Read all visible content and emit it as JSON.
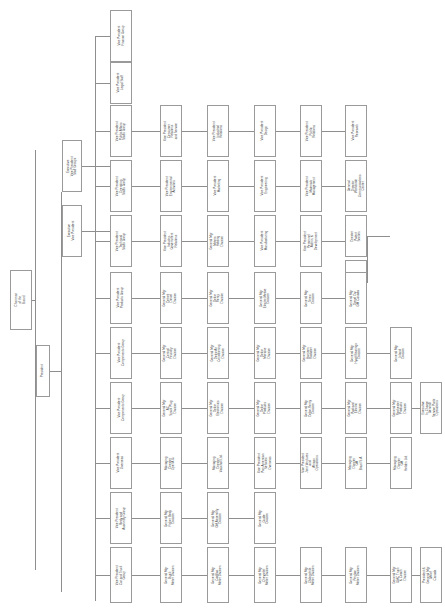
{
  "chart": {
    "orientation": "rotated-90",
    "box_fill": "#ffffff",
    "box_border": "#9a9a9a",
    "line_color": "#8e8e8e",
    "nodes": [
      {
        "id": "chairman",
        "label": "Chairman\nof the\nBoard"
      },
      {
        "id": "president",
        "label": "President"
      },
      {
        "id": "evp_staff",
        "label": "Executive\nVice President\nStaff Groups"
      },
      {
        "id": "vp_finance",
        "label": "Vice President\nFinance Group"
      },
      {
        "id": "vp_legal",
        "label": "Vice President\nLegal Staff"
      },
      {
        "id": "vp_pubaffairs",
        "label": "Vice President\nPublic Affairs\nStaffs Group"
      },
      {
        "id": "vp_operating",
        "label": "Vice President\nOperating\nStaffs Group"
      },
      {
        "id": "vp_technical",
        "label": "Vice President\nTechnical\nStaffs Group"
      },
      {
        "id": "vp_consumer",
        "label": "Vice President\nConsumer\nRelations\nand Service"
      },
      {
        "id": "vp_environ",
        "label": "Vice President\nEnvironmental\nActivities"
      },
      {
        "id": "vp_indgov",
        "label": "Vice President\nIndustry-\nGovernment\nRelations"
      },
      {
        "id": "vp_public",
        "label": "Vice President\nPublic\nRelations"
      },
      {
        "id": "vp_indrel",
        "label": "Vice President\nIndustrial\nRelations"
      },
      {
        "id": "vp_marketing",
        "label": "Vice President\nMarketing"
      },
      {
        "id": "gm_motorsholding",
        "label": "General Mgr\nMotors\nHolding\nDivision"
      },
      {
        "id": "vp_materials",
        "label": "Vice President\nMaterials\nManagement"
      },
      {
        "id": "vp_personnel",
        "label": "Vice President\nPersonnel\nAdmin. &\nDevelopment"
      },
      {
        "id": "vp_design",
        "label": "Vice President\nDesign"
      },
      {
        "id": "vp_engineering",
        "label": "Vice President\nEngineering"
      },
      {
        "id": "vp_manufacturing",
        "label": "Vice President\nManufacturing"
      },
      {
        "id": "vp_research",
        "label": "Vice President\nResearch"
      },
      {
        "id": "gd_worldwide",
        "label": "General\nDirector\nWorldwide\nCommunications\nCenter"
      },
      {
        "id": "dir_patent",
        "label": "Director\nPatent\nSection"
      },
      {
        "id": "dir_mfgmat",
        "label": "Director\nMfg Materials\nProblem\nResolution\nGroup"
      },
      {
        "id": "evp_products",
        "label": "Executive\nVice President"
      },
      {
        "id": "vp_prodgroup",
        "label": "Vice President\nProducts Group"
      },
      {
        "id": "vp_componentsa",
        "label": "Vice President\nComponents Group"
      },
      {
        "id": "vp_componentsb",
        "label": "Vice President\nComponents Group"
      },
      {
        "id": "vp_overseas",
        "label": "Vice President\nOverseas"
      },
      {
        "id": "vp_bodyassy",
        "label": "Vice President\nBody and\nAssembly Group"
      },
      {
        "id": "vp_cartruck",
        "label": "Vice President\nCar and Truck\nGroup"
      },
      {
        "id": "gm_detdiesel",
        "label": "General Mgr\nDetroit\nDiesel\nDivision"
      },
      {
        "id": "gm_delcoremy",
        "label": "General Mgr\nDelco\nRemy\nDivision"
      },
      {
        "id": "gm_electromotive",
        "label": "General Mgr\nElectro-Motive\nDivision"
      },
      {
        "id": "gm_terex",
        "label": "General Mgr\nTerex\nDivision"
      },
      {
        "id": "gm_dieselcanada",
        "label": "General Mgr\nDiesel Div\nGM Canada"
      },
      {
        "id": "gm_centfoundry",
        "label": "General Mgr\nCentral\nFoundry\nDivision"
      },
      {
        "id": "gm_delcoair",
        "label": "General Mgr\nDelco Air\nConditioning\nDivision"
      },
      {
        "id": "gm_delcomoraine",
        "label": "General Mgr\nDelco\nMoraine\nDivision"
      },
      {
        "id": "gm_harrison",
        "label": "General Mgr\nHarrison\nRadiator\nDivision"
      },
      {
        "id": "gm_hyatt",
        "label": "General Mgr\nHyatt Bearings\nDivision"
      },
      {
        "id": "gm_inland",
        "label": "General Mgr\nInland\nDivision"
      },
      {
        "id": "gm_acspark",
        "label": "General Mgr\nAC\nSpark Plug\nDivision"
      },
      {
        "id": "gm_delcoelec",
        "label": "General Mgr\nDelco\nElectronics\nDivision"
      },
      {
        "id": "gm_delcoprod",
        "label": "General Mgr\nDelco\nProducts\nDivision"
      },
      {
        "id": "gm_delcoremy2",
        "label": "General Mgr\nDelco-Remy\nDivision"
      },
      {
        "id": "gm_packard",
        "label": "General Mgr\nPackard\nElectric\nDivision"
      },
      {
        "id": "gm_rochester",
        "label": "General Mgr\nRochester\nProducts\nDivision"
      },
      {
        "id": "exec_gensvc",
        "label": "Executive\nIn Charge\nGeneral\nService Parts\nOperations"
      },
      {
        "id": "md_opel",
        "label": "Managing\nDirector\nOpel A.G."
      },
      {
        "id": "md_vauxhall",
        "label": "Managing\nDirector\nVauxhall Ltd."
      },
      {
        "id": "vp_panam",
        "label": "Vice President\nPan American\nVehicles\nOverseas"
      },
      {
        "id": "vp_jointvent",
        "label": "Vice President\nJoint Ventures\nand\nAfrican\nOperations"
      },
      {
        "id": "md_brazil",
        "label": "Managing\nDirector\nGM\nBrazil S.A."
      },
      {
        "id": "md_holden",
        "label": "Managing\nDirector\nGM\nHolden Ltd."
      },
      {
        "id": "gm_fisher",
        "label": "General Mgr\nFisher Body\nDivision"
      },
      {
        "id": "gm_gmassembly",
        "label": "General Mgr\nGM Assembly\nDivision"
      },
      {
        "id": "gm_guide",
        "label": "General Mgr\nGuide\nDivision"
      },
      {
        "id": "gm_buick",
        "label": "General Mgr\nBuick\nMotor Division"
      },
      {
        "id": "gm_cadillac",
        "label": "General Mgr\nCadillac\nMotor Division"
      },
      {
        "id": "gm_chevrolet",
        "label": "General Mgr\nChevrolet\nMotor Division"
      },
      {
        "id": "gm_oldsmobile",
        "label": "General Mgr\nOldsmobile\nMotor Division"
      },
      {
        "id": "gm_pontiac",
        "label": "General Mgr\nPontiac\nMotor Division"
      },
      {
        "id": "gm_gmctruck",
        "label": "General Mgr\nGMC Truck\n& Coach\nDivision"
      },
      {
        "id": "pres_gmcanada",
        "label": "President &\nGeneral Mgr\nGM of\nCanada"
      }
    ]
  }
}
